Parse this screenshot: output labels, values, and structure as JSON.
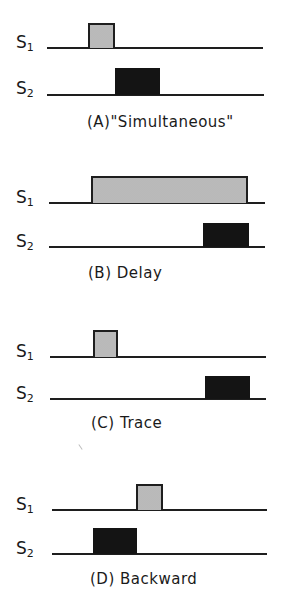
{
  "figure": {
    "type": "conditioning-procedures-timing-diagram",
    "colors": {
      "baseline": "#1e1e1e",
      "cs_fill": "#d4d4d4",
      "us_fill": "#141414"
    },
    "stimulus_labels": {
      "s1": {
        "letter": "S",
        "sub": "1"
      },
      "s2": {
        "letter": "S",
        "sub": "2"
      }
    },
    "panels": [
      {
        "id": "A",
        "caption": "(A)\"Simultaneous\"",
        "s1": {
          "baseline_y": 48,
          "line_x": [
            47,
            263
          ],
          "pulse": {
            "x": 88,
            "w": 27,
            "top": 23
          },
          "label_y": 34
        },
        "s2": {
          "baseline_y": 95,
          "line_x": [
            47,
            264
          ],
          "pulse": {
            "x": 115,
            "w": 45,
            "top": 68
          },
          "label_y": 80
        },
        "caption_pos": {
          "x": 87,
          "y": 113
        }
      },
      {
        "id": "B",
        "caption": "(B) Delay",
        "s1": {
          "baseline_y": 203,
          "line_x": [
            49,
            265
          ],
          "pulse": {
            "x": 91,
            "w": 157,
            "top": 176
          },
          "label_y": 189
        },
        "s2": {
          "baseline_y": 247,
          "line_x": [
            49,
            265
          ],
          "pulse": {
            "x": 203,
            "w": 46,
            "top": 223
          },
          "label_y": 233
        },
        "caption_pos": {
          "x": 88,
          "y": 264
        }
      },
      {
        "id": "C",
        "caption": "(C) Trace",
        "s1": {
          "baseline_y": 357,
          "line_x": [
            50,
            266
          ],
          "pulse": {
            "x": 93,
            "w": 25,
            "top": 330
          },
          "label_y": 343
        },
        "s2": {
          "baseline_y": 399,
          "line_x": [
            50,
            266
          ],
          "pulse": {
            "x": 205,
            "w": 45,
            "top": 376
          },
          "label_y": 385
        },
        "caption_pos": {
          "x": 91,
          "y": 414
        }
      },
      {
        "id": "D",
        "caption": "(D) Backward",
        "s1": {
          "baseline_y": 510,
          "line_x": [
            52,
            267
          ],
          "pulse": {
            "x": 136,
            "w": 27,
            "top": 484
          },
          "label_y": 496
        },
        "s2": {
          "baseline_y": 554,
          "line_x": [
            52,
            267
          ],
          "pulse": {
            "x": 93,
            "w": 44,
            "top": 528
          },
          "label_y": 540
        },
        "caption_pos": {
          "x": 90,
          "y": 570
        }
      }
    ]
  }
}
